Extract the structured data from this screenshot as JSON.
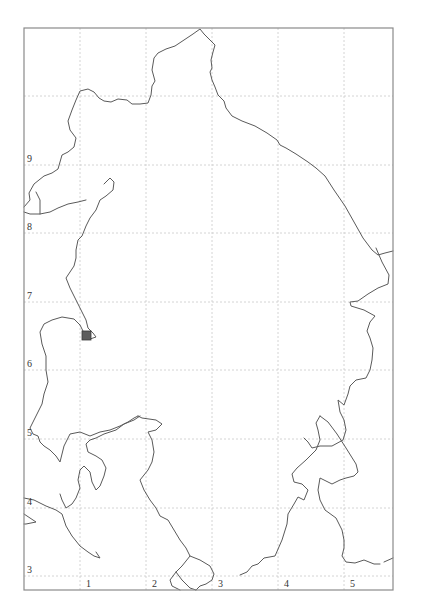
{
  "map": {
    "frame": {
      "left": 24,
      "top": 28,
      "right": 393,
      "bottom": 590
    },
    "grid": {
      "vertical_x": [
        80,
        146,
        212,
        278,
        344
      ],
      "horizontal_y": [
        96,
        165,
        233,
        302,
        370,
        439,
        508,
        576
      ]
    },
    "column_labels": [
      {
        "text": "1",
        "x": 86,
        "y": 587
      },
      {
        "text": "2",
        "x": 152,
        "y": 587
      },
      {
        "text": "3",
        "x": 218,
        "y": 587
      },
      {
        "text": "4",
        "x": 284,
        "y": 587
      },
      {
        "text": "5",
        "x": 350,
        "y": 587
      }
    ],
    "row_labels": [
      {
        "text": "9",
        "x": 27,
        "y": 162
      },
      {
        "text": "8",
        "x": 27,
        "y": 230
      },
      {
        "text": "7",
        "x": 27,
        "y": 299
      },
      {
        "text": "6",
        "x": 27,
        "y": 367
      },
      {
        "text": "5",
        "x": 27,
        "y": 436
      },
      {
        "text": "4",
        "x": 27,
        "y": 505
      },
      {
        "text": "3",
        "x": 27,
        "y": 573
      }
    ],
    "marker": {
      "x": 82,
      "y": 331,
      "size": 9,
      "color": "#5e5e5e"
    },
    "colors": {
      "coastline": "#5a5a5a",
      "grid": "#c9c9c9",
      "frame": "#8a8a8a",
      "background": "#ffffff"
    }
  }
}
